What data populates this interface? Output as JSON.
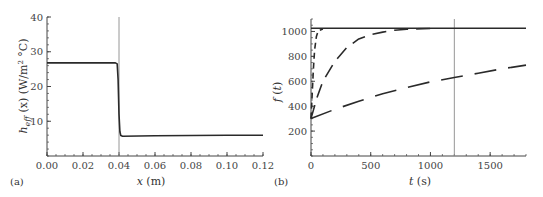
{
  "chart_data": [
    {
      "panel": "(a)",
      "type": "line",
      "title": "",
      "xlabel": "x (m)",
      "ylabel": "h_eff (x) (W/m² °C)",
      "xlim": [
        0,
        0.12
      ],
      "ylim": [
        0,
        40
      ],
      "xticks": [
        "0.00",
        "0.02",
        "0.04",
        "0.06",
        "0.08",
        "0.10",
        "0.12"
      ],
      "yticks": [
        "10",
        "20",
        "30",
        "40"
      ],
      "grid": false,
      "vertical_line_x": 0.04,
      "series": [
        {
          "name": "h_eff",
          "style": "solid",
          "x": [
            0.0,
            0.038,
            0.039,
            0.0395,
            0.04,
            0.0405,
            0.041,
            0.042,
            0.06,
            0.08,
            0.1,
            0.12
          ],
          "y": [
            26.8,
            26.8,
            26.5,
            22,
            12,
            7,
            5.9,
            5.7,
            5.8,
            5.9,
            6.0,
            6.0
          ]
        }
      ]
    },
    {
      "panel": "(b)",
      "type": "line",
      "title": "",
      "xlabel": "t (s)",
      "ylabel": "f (t)",
      "xlim": [
        0,
        1800
      ],
      "ylim": [
        0,
        1100
      ],
      "xticks": [
        "0",
        "500",
        "1000",
        "1500"
      ],
      "yticks": [
        "200",
        "400",
        "600",
        "800",
        "1000"
      ],
      "grid": false,
      "vertical_line_x": 1200,
      "series": [
        {
          "name": "solid-constant",
          "style": "solid",
          "x": [
            0,
            1800
          ],
          "y": [
            1025,
            1025
          ]
        },
        {
          "name": "short-dash-fast",
          "style": "dash-short",
          "x": [
            0,
            10,
            20,
            30,
            45,
            60,
            100
          ],
          "y": [
            300,
            500,
            700,
            850,
            960,
            1005,
            1020
          ]
        },
        {
          "name": "medium-dash",
          "style": "dash-medium",
          "x": [
            0,
            50,
            100,
            200,
            300,
            400,
            500,
            600,
            700,
            800,
            1000
          ],
          "y": [
            300,
            470,
            600,
            760,
            870,
            940,
            975,
            995,
            1010,
            1018,
            1024
          ]
        },
        {
          "name": "long-dash-slow",
          "style": "dash-long",
          "x": [
            0,
            200,
            400,
            600,
            800,
            1000,
            1200,
            1400,
            1600,
            1800
          ],
          "y": [
            300,
            375,
            440,
            500,
            550,
            595,
            630,
            665,
            700,
            730
          ]
        }
      ]
    }
  ],
  "labels": {
    "a": {
      "panel": "(a)",
      "xlabel": "x (m)",
      "ylabel": "h",
      "ylabel_sub": "eff",
      "ylabel_rest": " (x) (W/m",
      "ylabel_sup": "2",
      "ylabel_end": " °C)",
      "xticks": [
        "0.00",
        "0.02",
        "0.04",
        "0.06",
        "0.08",
        "0.10",
        "0.12"
      ],
      "yticks": [
        "10",
        "20",
        "30",
        "40"
      ]
    },
    "b": {
      "panel": "(b)",
      "xlabel": "t (s)",
      "ylabel": "f (t)",
      "xticks": [
        "0",
        "500",
        "1000",
        "1500"
      ],
      "yticks": [
        "200",
        "400",
        "600",
        "800",
        "1000"
      ]
    }
  },
  "colors": {
    "curve": "#2a2a2a",
    "axis": "#444444",
    "vline": "#8a8a8a"
  }
}
